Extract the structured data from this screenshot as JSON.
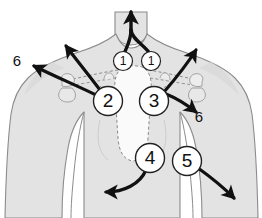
{
  "figure": {
    "background_color": "#ffffff",
    "body_fill": "#e3e3e3",
    "body_outline": "#8c8c8c",
    "bone_fill": "#f2f2f2",
    "bone_outline": "#9a9a9a",
    "dashed_outline_color": "#8a8a8a",
    "arrow_color": "#111111",
    "marker_fill": "#ffffff",
    "marker_stroke": "#222222",
    "marker_text_color": "#111111"
  },
  "markers": [
    {
      "id": "marker-1-left",
      "label": "1",
      "cx": 123,
      "cy": 61,
      "r": 9.5,
      "font_size": 12
    },
    {
      "id": "marker-1-right",
      "label": "1",
      "cx": 151,
      "cy": 61,
      "r": 9.5,
      "font_size": 12
    },
    {
      "id": "marker-2",
      "label": "2",
      "cx": 108,
      "cy": 101,
      "r": 14.5,
      "font_size": 19
    },
    {
      "id": "marker-3",
      "label": "3",
      "cx": 154,
      "cy": 101,
      "r": 14.5,
      "font_size": 19
    },
    {
      "id": "marker-4",
      "label": "4",
      "cx": 150,
      "cy": 158,
      "r": 14.5,
      "font_size": 19
    },
    {
      "id": "marker-5",
      "label": "5",
      "cx": 187,
      "cy": 161,
      "r": 14.5,
      "font_size": 19
    }
  ],
  "side_labels": [
    {
      "id": "label-6-left",
      "label": "6",
      "x": 17,
      "y": 62,
      "font_size": 15
    },
    {
      "id": "label-6-right",
      "label": "6",
      "x": 199,
      "y": 118,
      "font_size": 15
    }
  ],
  "arrows": [
    {
      "id": "arrow-neck-up",
      "from": "markers 1",
      "direction": "superior",
      "style": "y-shaped-merging"
    },
    {
      "id": "arrow-2-upleft",
      "from": "marker 2",
      "direction": "superolateral",
      "style": "straight"
    },
    {
      "id": "arrow-2-left-curved",
      "from": "marker 2",
      "direction": "lateral-left",
      "style": "curved"
    },
    {
      "id": "arrow-3-upright",
      "from": "marker 3",
      "direction": "superolateral",
      "style": "straight"
    },
    {
      "id": "arrow-3-downright",
      "from": "marker 3",
      "direction": "inferolateral",
      "style": "straight"
    },
    {
      "id": "arrow-4-downleft",
      "from": "marker 4",
      "direction": "inferolateral",
      "style": "curved"
    },
    {
      "id": "arrow-5-downright",
      "from": "marker 5",
      "direction": "inferolateral",
      "style": "straight"
    }
  ]
}
